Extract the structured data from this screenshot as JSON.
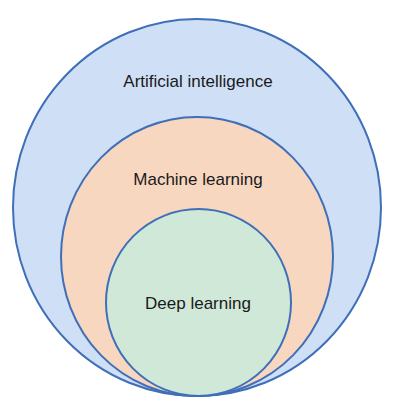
{
  "diagram": {
    "type": "nested-venn",
    "circles": [
      {
        "label": "Artificial intelligence",
        "fill": "#cfe0f6",
        "stroke": "#3f6fb8"
      },
      {
        "label": "Machine learning",
        "fill": "#f8d7c0",
        "stroke": "#3f6fb8"
      },
      {
        "label": "Deep learning",
        "fill": "#cfe8d8",
        "stroke": "#3f6fb8"
      }
    ]
  }
}
